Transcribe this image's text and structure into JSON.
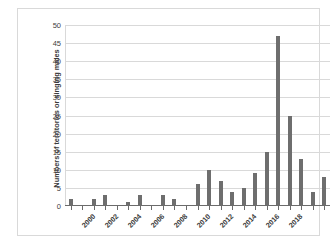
{
  "chart_data": {
    "type": "bar",
    "title": "",
    "xlabel": "",
    "ylabel": "Numbers of territories or singing males",
    "ylim": [
      0,
      50
    ],
    "ytick_step": 5,
    "yticks": [
      0,
      5,
      10,
      15,
      20,
      25,
      30,
      35,
      40,
      45,
      50
    ],
    "ytick_labels": [
      "0",
      "5",
      "10",
      "15",
      "20",
      "25",
      "30",
      "35",
      "40",
      "45",
      "50"
    ],
    "grid": true,
    "legend": false,
    "bar_color": "#6e6e6e",
    "gridline_color": "#d9d9d9",
    "axis_color": "#6b6b6b",
    "background": "#ffffff",
    "categories": [
      "2000",
      "2001",
      "2002",
      "2003",
      "2004",
      "2005",
      "2006",
      "2007",
      "2008",
      "2009",
      "2010",
      "2011",
      "2012",
      "2013",
      "2014",
      "2015",
      "2016",
      "2017",
      "2018",
      "2019",
      "2020",
      "2021",
      "2022"
    ],
    "values": [
      2,
      0,
      2,
      3,
      0,
      1,
      3,
      0,
      3,
      2,
      0,
      6,
      10,
      7,
      4,
      5,
      9,
      15,
      47,
      25,
      13,
      4,
      8
    ],
    "xtick_labels_shown": [
      "2000",
      "2002",
      "2004",
      "2006",
      "2008",
      "2010",
      "2012",
      "2014",
      "2016",
      "2018"
    ],
    "xtick_label_indices": [
      0,
      2,
      4,
      6,
      8,
      10,
      12,
      14,
      16,
      18
    ],
    "xtick_label_rotation": -45
  }
}
